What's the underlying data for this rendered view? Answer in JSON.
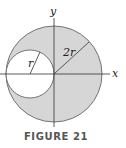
{
  "diagram": {
    "axes": {
      "x_label": "x",
      "y_label": "y"
    },
    "large_circle": {
      "radius_label": "2r",
      "fill": "#d6d6d6"
    },
    "small_circle": {
      "radius_label": "r",
      "fill": "#ffffff"
    },
    "caption": "FIGURE 21"
  }
}
